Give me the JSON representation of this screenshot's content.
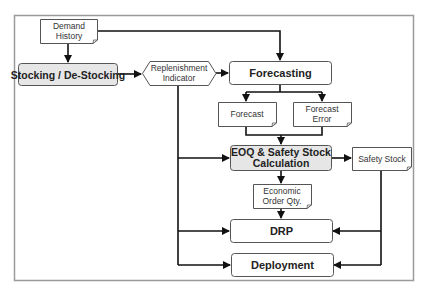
{
  "diagram": {
    "title": "",
    "nodes": {
      "demand_history": {
        "lines": [
          "Demand",
          "History"
        ],
        "shape": "document"
      },
      "stocking": {
        "lines": [
          "Stocking / De-Stocking"
        ],
        "shape": "process-shaded"
      },
      "replenishment_indicator": {
        "lines": [
          "Replenishment",
          "Indicator"
        ],
        "shape": "hexagon"
      },
      "forecasting": {
        "lines": [
          "Forecasting"
        ],
        "shape": "process"
      },
      "forecast": {
        "lines": [
          "Forecast"
        ],
        "shape": "document"
      },
      "forecast_error": {
        "lines": [
          "Forecast",
          "Error"
        ],
        "shape": "document"
      },
      "eoq_safety": {
        "lines": [
          "EOQ & Safety Stock",
          "Calculation"
        ],
        "shape": "process-shaded"
      },
      "safety_stock": {
        "lines": [
          "Safety Stock"
        ],
        "shape": "document"
      },
      "economic_order_qty": {
        "lines": [
          "Economic",
          "Order Qty."
        ],
        "shape": "document"
      },
      "drp": {
        "lines": [
          "DRP"
        ],
        "shape": "process"
      },
      "deployment": {
        "lines": [
          "Deployment"
        ],
        "shape": "process"
      }
    },
    "edges": [
      {
        "from": "demand_history",
        "to": "stocking"
      },
      {
        "from": "demand_history",
        "to": "forecasting"
      },
      {
        "from": "stocking",
        "to": "replenishment_indicator"
      },
      {
        "from": "replenishment_indicator",
        "to": "forecasting"
      },
      {
        "from": "replenishment_indicator",
        "to": "eoq_safety"
      },
      {
        "from": "replenishment_indicator",
        "to": "drp"
      },
      {
        "from": "replenishment_indicator",
        "to": "deployment"
      },
      {
        "from": "forecasting",
        "to": "forecast"
      },
      {
        "from": "forecasting",
        "to": "forecast_error"
      },
      {
        "from": "forecast",
        "to": "eoq_safety"
      },
      {
        "from": "forecast_error",
        "to": "eoq_safety"
      },
      {
        "from": "eoq_safety",
        "to": "safety_stock"
      },
      {
        "from": "eoq_safety",
        "to": "economic_order_qty"
      },
      {
        "from": "economic_order_qty",
        "to": "drp"
      },
      {
        "from": "safety_stock",
        "to": "drp"
      },
      {
        "from": "safety_stock",
        "to": "deployment"
      }
    ],
    "colors": {
      "frame": "#999999",
      "line": "#111111",
      "box_border": "#555555",
      "shaded_fill": "#e6e6e6",
      "plain_fill": "#ffffff"
    }
  }
}
